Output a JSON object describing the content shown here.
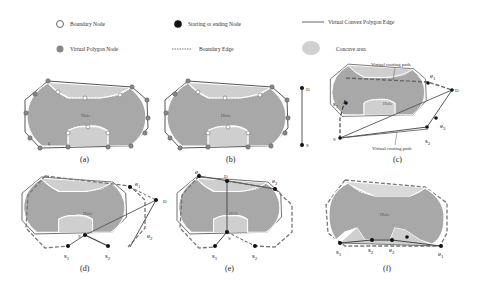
{
  "legend": {
    "boundary_node": "Boundary Node",
    "start_end_node": "Starting or ending Node",
    "virtual_edge": "Virtual Convex Polygon Edge",
    "virtual_node": "Virtual Polygon Node",
    "boundary_edge": "Boundary Edge",
    "concave_area": "Concave area"
  },
  "colors": {
    "hole_fill": "#a8a8a8",
    "concave_fill": "#cfcfcf",
    "edge": "#555555",
    "virtual_node": "#888888",
    "start_node": "#111111"
  },
  "panels": [
    {
      "caption": "(a)",
      "hole_label": "Hole",
      "extra": "ζ"
    },
    {
      "caption": "(b)",
      "hole_label": "Hole",
      "d_label": "D",
      "s_label": "S"
    },
    {
      "caption": "(c)",
      "hole_label": "Hole",
      "path_top": "Virtual routing path",
      "path_bottom": "Virtual routing path",
      "s_label": "S",
      "d_label": "D",
      "s1": "s",
      "s1_sub": "1",
      "s2": "s",
      "s2_sub": "2",
      "e1": "e",
      "e1_sub": "1",
      "e2": "e",
      "e2_sub": "2"
    },
    {
      "caption": "(d)",
      "hole_label": "Hole",
      "s_label": "S",
      "d_label": "D",
      "s1": "s",
      "s1_sub": "1",
      "s2": "s",
      "s2_sub": "2",
      "e1": "e",
      "e1_sub": "1",
      "e2": "e",
      "e2_sub": "2"
    },
    {
      "caption": "(e)",
      "hole_label": "Hole",
      "s_label": "S",
      "d_label": "D",
      "s1": "s",
      "s1_sub": "1",
      "s2": "s",
      "s2_sub": "2",
      "e1": "e",
      "e1_sub": "1",
      "e2": "e",
      "e2_sub": "2"
    },
    {
      "caption": "(f)",
      "hole_label": "Hole",
      "s1": "s",
      "s1_sub": "1",
      "s2": "s",
      "s2_sub": "2",
      "e1": "e",
      "e1_sub": "1",
      "e2": "e",
      "e2_sub": "2"
    }
  ]
}
